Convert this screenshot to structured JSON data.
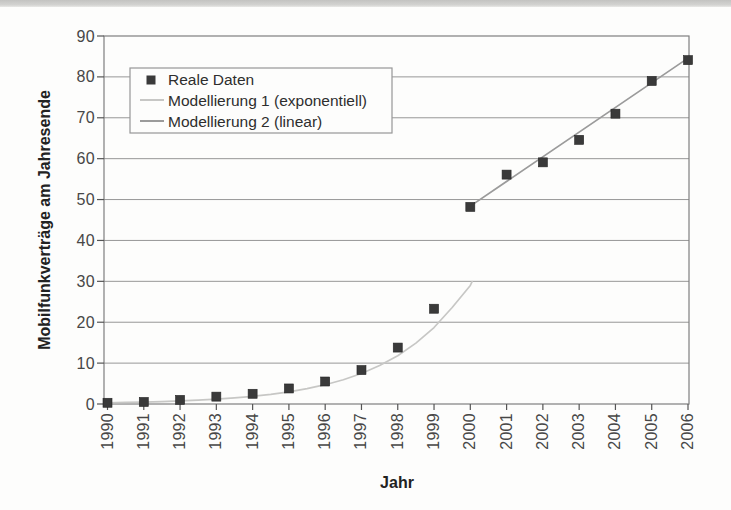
{
  "page": {
    "background": "#fdfdfc",
    "scan_band_color": "#cccccb"
  },
  "chart_data": {
    "type": "scatter",
    "title": "",
    "xlabel": "Jahr",
    "ylabel": "Mobilfunkverträge am Jahresende",
    "xlim": [
      1989.9,
      2006.05
    ],
    "ylim": [
      0,
      90
    ],
    "x_ticks": [
      1990,
      1991,
      1992,
      1993,
      1994,
      1995,
      1996,
      1997,
      1998,
      1999,
      2000,
      2001,
      2002,
      2003,
      2004,
      2005,
      2006
    ],
    "y_ticks": [
      0,
      10,
      20,
      30,
      40,
      50,
      60,
      70,
      80,
      90
    ],
    "grid": "horizontal",
    "legend_position": "top-left-inside",
    "series": [
      {
        "name": "Reale Daten",
        "type": "scatter",
        "marker": "square",
        "color": "#3a3a3a",
        "x": [
          1990,
          1991,
          1992,
          1993,
          1994,
          1995,
          1996,
          1997,
          1998,
          1999,
          2000,
          2001,
          2002,
          2003,
          2004,
          2005,
          2006
        ],
        "values": [
          0.3,
          0.5,
          1.0,
          1.8,
          2.5,
          3.8,
          5.5,
          8.3,
          13.8,
          23.3,
          48.2,
          56.1,
          59.1,
          64.6,
          71.0,
          79.0,
          84.1
        ]
      },
      {
        "name": "Modellierung 1 (exponentiell)",
        "type": "line",
        "color": "#c7c7c5",
        "points": [
          [
            1990,
            0.3
          ],
          [
            1990.5,
            0.38
          ],
          [
            1991,
            0.48
          ],
          [
            1991.5,
            0.6
          ],
          [
            1992,
            0.75
          ],
          [
            1992.5,
            0.95
          ],
          [
            1993,
            1.19
          ],
          [
            1993.5,
            1.5
          ],
          [
            1994,
            1.88
          ],
          [
            1994.5,
            2.37
          ],
          [
            1995,
            2.98
          ],
          [
            1995.5,
            3.75
          ],
          [
            1996,
            4.72
          ],
          [
            1996.5,
            5.94
          ],
          [
            1997,
            7.47
          ],
          [
            1997.5,
            9.4
          ],
          [
            1998,
            11.8
          ],
          [
            1998.5,
            14.9
          ],
          [
            1999,
            18.7
          ],
          [
            1999.5,
            23.6
          ],
          [
            2000,
            29.0
          ],
          [
            2000.05,
            29.9
          ]
        ]
      },
      {
        "name": "Modellierung 2 (linear)",
        "type": "line",
        "color": "#9b9b9b",
        "points": [
          [
            2000,
            48.4
          ],
          [
            2006,
            84.6
          ]
        ]
      }
    ],
    "legend": [
      {
        "label": "Reale Daten",
        "swatch": "square-marker",
        "color": "#3a3a3a"
      },
      {
        "label": "Modellierung 1 (exponentiell)",
        "swatch": "line",
        "color": "#c7c7c5"
      },
      {
        "label": "Modellierung 2 (linear)",
        "swatch": "line",
        "color": "#9b9b9b"
      }
    ]
  }
}
